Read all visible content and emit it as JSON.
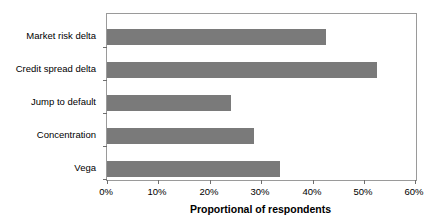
{
  "chart_data": {
    "type": "bar",
    "orientation": "horizontal",
    "title": "",
    "xlabel": "Proportional of respondents",
    "ylabel": "",
    "categories": [
      "Market risk delta",
      "Credit spread delta",
      "Jump to default",
      "Concentration",
      "Vega"
    ],
    "values": [
      42.5,
      52.5,
      24.0,
      28.5,
      33.5
    ],
    "value_unit": "%",
    "xlim": [
      0,
      60
    ],
    "xticks": [
      0,
      10,
      20,
      30,
      40,
      50,
      60
    ],
    "xtick_labels": [
      "0%",
      "10%",
      "20%",
      "30%",
      "40%",
      "50%",
      "60%"
    ],
    "grid": false,
    "legend": false,
    "series": [
      {
        "name": "Proportional of respondents",
        "values": [
          42.5,
          52.5,
          24.0,
          28.5,
          33.5
        ]
      }
    ],
    "colors": {
      "bar_fill": "#7a7a7a",
      "frame": "#9a9a9a",
      "text": "#000000",
      "background": "#ffffff"
    }
  }
}
